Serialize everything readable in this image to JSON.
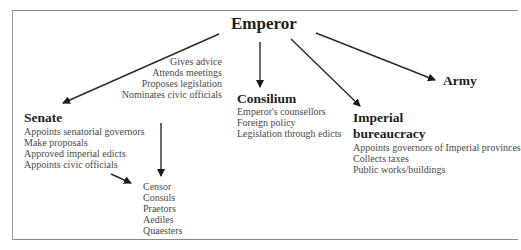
{
  "diagram": {
    "root": {
      "label": "Emperor"
    },
    "emperor_to_senate_roles": [
      "Gives advice",
      "Attends meetings",
      "Proposes legislation",
      "Nominates civic officials"
    ],
    "senate": {
      "label": "Senate",
      "items": [
        "Appoints senatorial governors",
        "Make proposals",
        "Approved imperial edicts",
        "Appoints civic officials"
      ]
    },
    "magistrates": {
      "items": [
        "Censor",
        "Consuls",
        "Praetors",
        "Aediles",
        "Quaesters"
      ]
    },
    "consilium": {
      "label": "Consilium",
      "items": [
        "Emperor's counsellors",
        "Foreign policy",
        "Legislation through edicts"
      ]
    },
    "bureaucracy": {
      "label_line1": "Imperial",
      "label_line2": "bureaucracy",
      "items": [
        "Appoints governors of Imperial provinces",
        "Collects taxes",
        "Public works/buildings"
      ]
    },
    "army": {
      "label": "Army"
    },
    "edges": [
      {
        "from": "Emperor",
        "to": "Senate"
      },
      {
        "from": "Emperor",
        "to": "Consilium"
      },
      {
        "from": "Emperor",
        "to": "Imperial bureaucracy"
      },
      {
        "from": "Emperor",
        "to": "Army"
      },
      {
        "from": "Senate",
        "to": "Magistrates"
      }
    ]
  }
}
